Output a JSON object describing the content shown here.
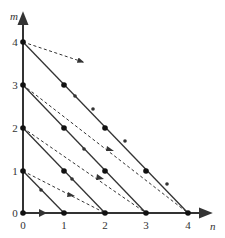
{
  "diagram": {
    "axes": {
      "x_label": "n",
      "y_label": "m",
      "x_ticks": [
        "0",
        "1",
        "2",
        "3",
        "4"
      ],
      "y_ticks": [
        "0",
        "1",
        "2",
        "3",
        "4"
      ]
    },
    "solid_lines": [
      {
        "from": [
          0,
          1
        ],
        "to": [
          1,
          0
        ]
      },
      {
        "from": [
          0,
          2
        ],
        "to": [
          2,
          0
        ]
      },
      {
        "from": [
          0,
          3
        ],
        "to": [
          3,
          0
        ]
      },
      {
        "from": [
          0,
          4
        ],
        "to": [
          4,
          0
        ]
      }
    ],
    "dashed_arrows": [
      {
        "from": [
          0,
          1
        ],
        "to": [
          2,
          0
        ]
      },
      {
        "from": [
          0,
          2
        ],
        "to": [
          3,
          0
        ]
      },
      {
        "from": [
          0,
          3
        ],
        "to": [
          4,
          0
        ]
      },
      {
        "from": [
          0,
          4
        ],
        "to": [
          1.45,
          3.1
        ]
      }
    ],
    "lattice_points": [
      [
        0,
        0
      ],
      [
        1,
        0
      ],
      [
        2,
        0
      ],
      [
        3,
        0
      ],
      [
        4,
        0
      ],
      [
        0,
        1
      ],
      [
        1,
        1
      ],
      [
        2,
        1
      ],
      [
        3,
        1
      ],
      [
        0,
        2
      ],
      [
        1,
        2
      ],
      [
        2,
        2
      ],
      [
        0,
        3
      ],
      [
        1,
        3
      ],
      [
        0,
        4
      ]
    ],
    "colors": {
      "line": "#333333",
      "background": "#ffffff"
    }
  }
}
